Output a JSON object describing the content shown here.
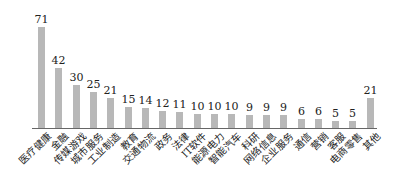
{
  "chart_data": {
    "type": "bar",
    "title": "",
    "xlabel": "",
    "ylabel": "",
    "categories": [
      "医疗健康",
      "金融",
      "传媒游戏",
      "城市服务",
      "工业制造",
      "教育",
      "交通物流",
      "政务",
      "法律",
      "IT软件",
      "能源电力",
      "智能汽车",
      "科研",
      "网络信息",
      "企业服务",
      "通信",
      "营销",
      "客服",
      "电商零售",
      "其他"
    ],
    "values": [
      71,
      42,
      30,
      25,
      21,
      15,
      14,
      12,
      11,
      10,
      10,
      10,
      9,
      9,
      9,
      6,
      6,
      5,
      5,
      21
    ],
    "ylim": [
      0,
      71
    ],
    "grid": false,
    "legend": "none",
    "bar_color": "#b8b8b8",
    "data_labels": true
  }
}
